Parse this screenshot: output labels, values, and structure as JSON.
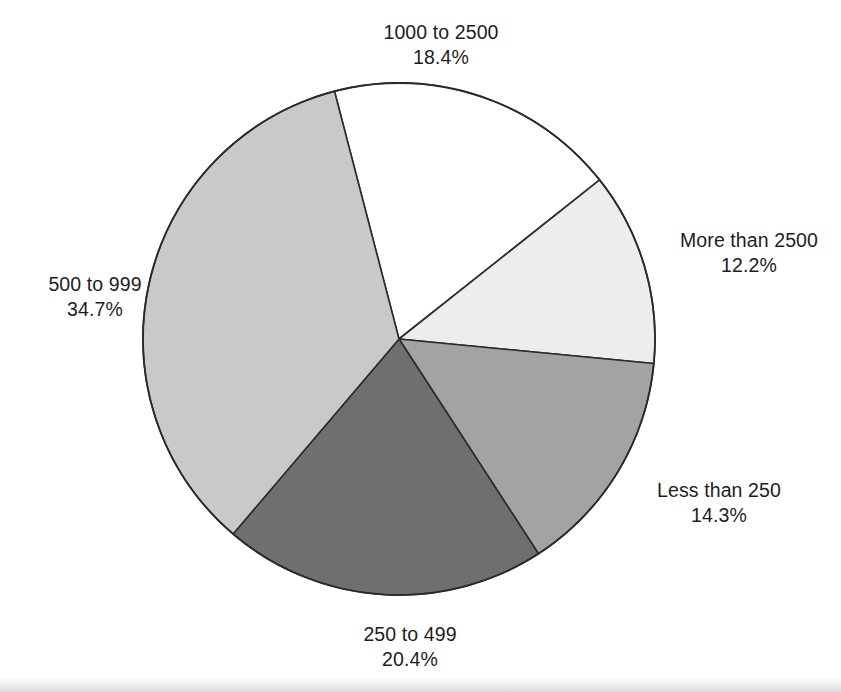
{
  "chart_data": {
    "type": "pie",
    "title": "",
    "subtitle": "",
    "xlabel": "",
    "ylabel": "",
    "legend_position": "outside-labels",
    "grid": false,
    "start_angle_deg": -14.6,
    "direction": "clockwise",
    "center": {
      "x": 399,
      "y": 339
    },
    "radius": 256,
    "categories": [
      "1000 to 2500",
      "More than 2500",
      "Less than 250",
      "250 to 499",
      "500 to 999"
    ],
    "values": [
      18.4,
      12.2,
      14.3,
      20.4,
      34.7
    ],
    "value_suffix": "%",
    "slices": [
      {
        "label": "1000 to 2500",
        "percent_text": "18.4%",
        "value": 18.4,
        "fill": "#ffffff",
        "stroke": "#2b2b2b",
        "start_deg": -14.6,
        "end_deg": 51.6,
        "label_position": "top"
      },
      {
        "label": "More than 2500",
        "percent_text": "12.2%",
        "value": 12.2,
        "fill": "#ededed",
        "stroke": "#2b2b2b",
        "start_deg": 51.6,
        "end_deg": 95.5,
        "label_position": "right-upper"
      },
      {
        "label": "Less than 250",
        "percent_text": "14.3%",
        "value": 14.3,
        "fill": "#a3a3a3",
        "stroke": "#2b2b2b",
        "start_deg": 95.5,
        "end_deg": 147.0,
        "label_position": "right-lower"
      },
      {
        "label": "250 to 499",
        "percent_text": "20.4%",
        "value": 20.4,
        "fill": "#6f6f6f",
        "stroke": "#2b2b2b",
        "start_deg": 147.0,
        "end_deg": 220.4,
        "label_position": "bottom"
      },
      {
        "label": "500 to 999",
        "percent_text": "34.7%",
        "value": 34.7,
        "fill": "#c9c9c9",
        "stroke": "#2b2b2b",
        "start_deg": 220.4,
        "end_deg": 345.4,
        "label_position": "left"
      }
    ],
    "colors": {
      "outline": "#2b2b2b",
      "text": "#1d1d1d",
      "background": "#ffffff"
    }
  },
  "labels": {
    "top": {
      "name": "1000 to 2500",
      "pct": "18.4%"
    },
    "right_upper": {
      "name": "More than 2500",
      "pct": "12.2%"
    },
    "right_lower": {
      "name": "Less than 250",
      "pct": "14.3%"
    },
    "bottom": {
      "name": "250 to 499",
      "pct": "20.4%"
    },
    "left": {
      "name": "500 to 999",
      "pct": "34.7%"
    }
  }
}
